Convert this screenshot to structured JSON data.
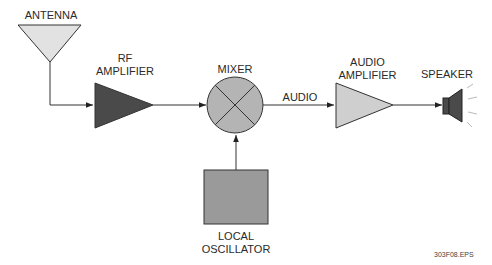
{
  "diagram": {
    "type": "block-diagram",
    "blocks": [
      {
        "id": "antenna",
        "label": "ANTENNA",
        "shape": "inverted-triangle",
        "fill": "#e2e2e2"
      },
      {
        "id": "rf_amplifier",
        "label_line1": "RF",
        "label_line2": "AMPLIFIER",
        "shape": "triangle",
        "fill": "#4a4a4a"
      },
      {
        "id": "mixer",
        "label": "MIXER",
        "shape": "circle-x",
        "fill": "#b4b4b4"
      },
      {
        "id": "audio_amplifier",
        "label_line1": "AUDIO",
        "label_line2": "AMPLIFIER",
        "shape": "triangle",
        "fill": "#cfcfcf"
      },
      {
        "id": "speaker",
        "label": "SPEAKER",
        "shape": "speaker",
        "fill": "#4a4a4a"
      },
      {
        "id": "local_oscillator",
        "label_line1": "LOCAL",
        "label_line2": "OSCILLATOR",
        "shape": "rectangle",
        "fill": "#9a9a9a"
      }
    ],
    "connections": [
      {
        "from": "antenna",
        "to": "rf_amplifier",
        "label": ""
      },
      {
        "from": "rf_amplifier",
        "to": "mixer",
        "label": ""
      },
      {
        "from": "mixer",
        "to": "audio_amplifier",
        "label": "AUDIO"
      },
      {
        "from": "audio_amplifier",
        "to": "speaker",
        "label": ""
      },
      {
        "from": "local_oscillator",
        "to": "mixer",
        "label": ""
      }
    ],
    "file_label": "303F08.EPS"
  },
  "labels": {
    "antenna": "ANTENNA",
    "rf_line1": "RF",
    "rf_line2": "AMPLIFIER",
    "mixer": "MIXER",
    "audio_signal": "AUDIO",
    "audio_amp_line1": "AUDIO",
    "audio_amp_line2": "AMPLIFIER",
    "speaker": "SPEAKER",
    "lo_line1": "LOCAL",
    "lo_line2": "OSCILLATOR",
    "file": "303F08.EPS"
  }
}
